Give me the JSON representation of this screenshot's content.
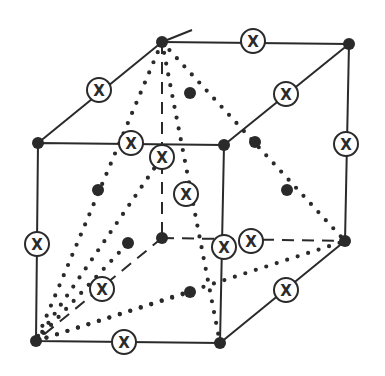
{
  "diagram": {
    "colors": {
      "ink": "#2a2a2a",
      "background": "#ffffff"
    },
    "marker_label": "X",
    "vertices": {
      "front_top_left": [
        38,
        143
      ],
      "front_top_right": [
        224,
        145
      ],
      "front_bottom_left": [
        36,
        341
      ],
      "front_bottom_right": [
        220,
        343
      ],
      "back_top_left": [
        162,
        42
      ],
      "back_top_right": [
        349,
        44
      ],
      "back_bottom_left": [
        162,
        238
      ],
      "back_bottom_right": [
        345,
        241
      ]
    },
    "face_centers": [
      [
        190,
        93
      ],
      [
        98,
        190
      ],
      [
        287,
        190
      ],
      [
        190,
        292
      ],
      [
        128,
        243
      ],
      [
        255,
        142
      ]
    ],
    "x_sites": [
      [
        99,
        90
      ],
      [
        253,
        41
      ],
      [
        286,
        94
      ],
      [
        131,
        143
      ],
      [
        162,
        157
      ],
      [
        346,
        144
      ],
      [
        186,
        194
      ],
      [
        37,
        244
      ],
      [
        224,
        247
      ],
      [
        251,
        241
      ],
      [
        286,
        290
      ],
      [
        102,
        289
      ],
      [
        124,
        342
      ]
    ]
  }
}
